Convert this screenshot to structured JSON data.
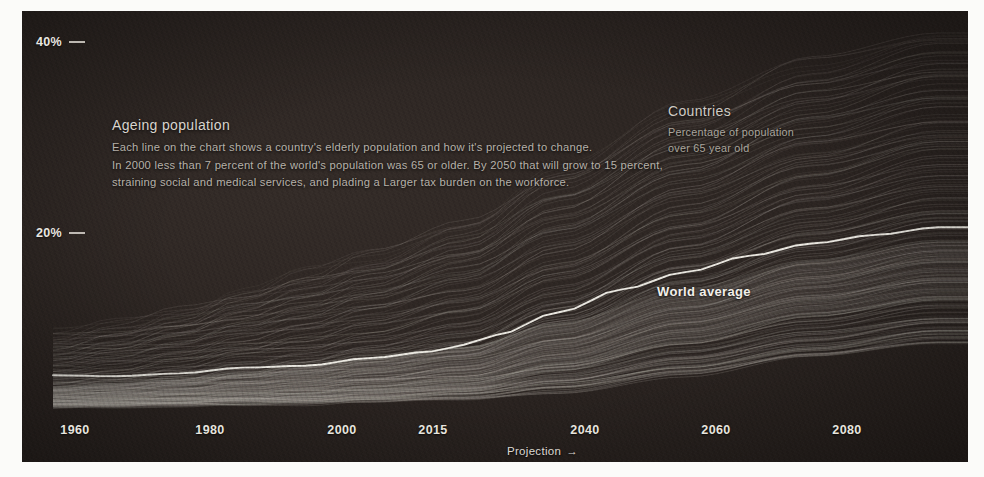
{
  "chart_data": {
    "type": "line",
    "title": "Ageing population",
    "subtitle_lines": [
      "Each line on the chart shows a country's elderly population and how it's projected to change.",
      "In 2000 less than 7 percent of the world's population was 65 or older. By 2050 that will grow to 15 percent,",
      "straining  social and medical services, and plading a Larger tax burden on the workforce."
    ],
    "xlabel": "",
    "ylabel": "",
    "xlim": [
      1950,
      2095
    ],
    "ylim": [
      0,
      44
    ],
    "grid": false,
    "legend_position": "top-right",
    "x_ticks": [
      {
        "label": "1960",
        "value": 1960
      },
      {
        "label": "1980",
        "value": 1980
      },
      {
        "label": "2000",
        "value": 2000
      },
      {
        "label": "2015",
        "value": 2015
      },
      {
        "label": "2040",
        "value": 2040
      },
      {
        "label": "2060",
        "value": 2060
      },
      {
        "label": "2080",
        "value": 2080
      }
    ],
    "y_ticks": [
      {
        "label": "40%",
        "value": 40
      },
      {
        "label": "20%",
        "value": 20
      }
    ],
    "annotations": [
      {
        "name": "projection",
        "text": "Projection",
        "arrow": "→",
        "value": 2015
      },
      {
        "name": "world-average",
        "text": "World average"
      }
    ],
    "legend": {
      "title": "Countries",
      "lines": [
        "Percentage of population",
        "over 65 year old"
      ]
    },
    "series": [
      {
        "name": "World average",
        "emphasis": true,
        "x": [
          1950,
          1960,
          1970,
          1980,
          1990,
          2000,
          2010,
          2015,
          2020,
          2030,
          2040,
          2050,
          2060,
          2070,
          2080,
          2090
        ],
        "values": [
          5.1,
          5.0,
          5.3,
          5.9,
          6.1,
          6.9,
          7.6,
          8.3,
          9.3,
          11.7,
          14.1,
          15.9,
          17.6,
          18.9,
          19.8,
          20.6
        ]
      },
      {
        "name": "Country lines (bundle)",
        "emphasis": false,
        "count": 200,
        "x": [
          1950,
          1960,
          1970,
          1980,
          1990,
          2000,
          2015,
          2030,
          2050,
          2070,
          2090
        ],
        "band_low": [
          2.0,
          2.1,
          2.2,
          2.3,
          2.4,
          2.6,
          2.9,
          3.8,
          5.6,
          7.5,
          9.0
        ],
        "band_high": [
          9.5,
          10.5,
          12.0,
          14.0,
          16.0,
          18.0,
          21.5,
          27.0,
          33.5,
          38.5,
          41.5
        ],
        "band_median": [
          4.5,
          4.7,
          5.2,
          6.0,
          6.6,
          7.6,
          9.2,
          13.0,
          18.5,
          23.0,
          26.0
        ]
      }
    ]
  },
  "colors": {
    "background": "#2a2320",
    "panel": "#312a26",
    "line_faint": "#bdb8b0",
    "line_world": "#f4f1ea",
    "text_primary": "#e9e6e0",
    "text_secondary": "#b6b1a9"
  }
}
